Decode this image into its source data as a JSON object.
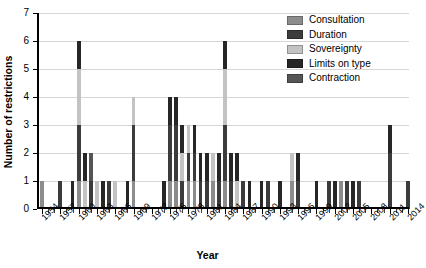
{
  "chart_data": {
    "type": "bar",
    "stacked": true,
    "title": "",
    "xlabel": "Year",
    "ylabel": "Number of restrictions",
    "ylim": [
      0,
      7
    ],
    "yticks": [
      0,
      1,
      2,
      3,
      4,
      5,
      6,
      7
    ],
    "grid": true,
    "legend_position": "top-right",
    "x_start": 1954,
    "x_end": 2014,
    "xtick_labels": [
      "1954",
      "1957",
      "1960",
      "1963",
      "1966",
      "1969",
      "1972",
      "1975",
      "1978",
      "1981",
      "1984",
      "1987",
      "1990",
      "1993",
      "1996",
      "1999",
      "2002",
      "2005",
      "2008",
      "2011",
      "2014"
    ],
    "series": [
      {
        "name": "Consultation",
        "color": "#8c8c8c"
      },
      {
        "name": "Duration",
        "color": "#3b3b3b"
      },
      {
        "name": "Sovereignty",
        "color": "#c3c3c3"
      },
      {
        "name": "Limits on type",
        "color": "#262626"
      },
      {
        "name": "Contraction",
        "color": "#555555"
      }
    ],
    "categories": [
      1954,
      1955,
      1956,
      1957,
      1958,
      1959,
      1960,
      1961,
      1962,
      1963,
      1964,
      1965,
      1966,
      1967,
      1968,
      1969,
      1970,
      1971,
      1972,
      1973,
      1974,
      1975,
      1976,
      1977,
      1978,
      1979,
      1980,
      1981,
      1982,
      1983,
      1984,
      1985,
      1986,
      1987,
      1988,
      1989,
      1990,
      1991,
      1992,
      1993,
      1994,
      1995,
      1996,
      1997,
      1998,
      1999,
      2000,
      2001,
      2002,
      2003,
      2004,
      2005,
      2006,
      2007,
      2008,
      2009,
      2010,
      2011,
      2012,
      2013,
      2014
    ],
    "values": {
      "Consultation": [
        1,
        0,
        0,
        0,
        0,
        0,
        1,
        0,
        0,
        0,
        0,
        0,
        0,
        0,
        0,
        1,
        0,
        0,
        0,
        0,
        0,
        1,
        1,
        0,
        1,
        1,
        0,
        0,
        1,
        0,
        1,
        0,
        0,
        0,
        0,
        0,
        0,
        0,
        0,
        0,
        0,
        1,
        0,
        0,
        0,
        0,
        0,
        0,
        0,
        1,
        0,
        0,
        0,
        0,
        0,
        0,
        0,
        0,
        0,
        0,
        0
      ],
      "Duration": [
        0,
        0,
        0,
        1,
        0,
        0,
        2,
        0,
        1,
        0,
        0,
        1,
        0,
        0,
        0,
        2,
        0,
        0,
        0,
        0,
        0,
        2,
        2,
        1,
        1,
        1,
        1,
        1,
        0,
        1,
        2,
        1,
        0,
        1,
        0,
        0,
        0,
        1,
        0,
        0,
        0,
        0,
        1,
        0,
        0,
        0,
        0,
        1,
        0,
        0,
        1,
        0,
        1,
        0,
        0,
        0,
        0,
        2,
        0,
        0,
        1
      ],
      "Sovereignty": [
        0,
        0,
        0,
        0,
        0,
        0,
        2,
        1,
        0,
        1,
        0,
        0,
        1,
        0,
        0,
        1,
        0,
        0,
        0,
        0,
        0,
        0,
        0,
        1,
        1,
        0,
        0,
        0,
        1,
        0,
        2,
        0,
        1,
        0,
        0,
        0,
        0,
        0,
        0,
        0,
        0,
        1,
        0,
        0,
        0,
        0,
        0,
        0,
        0,
        0,
        0,
        0,
        0,
        0,
        0,
        0,
        0,
        0,
        0,
        0,
        0
      ],
      "Limits on type": [
        0,
        0,
        0,
        0,
        0,
        1,
        1,
        1,
        0,
        0,
        1,
        0,
        0,
        0,
        1,
        0,
        0,
        0,
        0,
        0,
        1,
        1,
        1,
        1,
        0,
        1,
        1,
        1,
        0,
        1,
        1,
        1,
        1,
        0,
        1,
        0,
        1,
        0,
        0,
        1,
        0,
        0,
        1,
        0,
        0,
        1,
        0,
        0,
        1,
        0,
        0,
        1,
        0,
        0,
        0,
        0,
        0,
        1,
        0,
        0,
        0
      ],
      "Contraction": [
        0,
        0,
        0,
        0,
        0,
        0,
        0,
        0,
        1,
        0,
        0,
        0,
        0,
        0,
        0,
        0,
        0,
        0,
        0,
        0,
        0,
        0,
        0,
        0,
        0,
        0,
        0,
        0,
        0,
        0,
        0,
        0,
        0,
        0,
        0,
        0,
        0,
        0,
        0,
        0,
        0,
        0,
        0,
        0,
        0,
        0,
        0,
        0,
        0,
        0,
        0,
        0,
        0,
        0,
        0,
        0,
        0,
        0,
        0,
        0,
        0
      ]
    },
    "totals": [
      1,
      0,
      0,
      1,
      0,
      1,
      6,
      2,
      2,
      1,
      1,
      1,
      1,
      0,
      1,
      4,
      0,
      0,
      0,
      0,
      1,
      4,
      4,
      3,
      3,
      3,
      2,
      2,
      2,
      2,
      6,
      2,
      2,
      1,
      1,
      0,
      1,
      1,
      0,
      1,
      0,
      2,
      2,
      0,
      0,
      1,
      0,
      1,
      1,
      1,
      1,
      1,
      1,
      0,
      0,
      0,
      0,
      3,
      0,
      0,
      1
    ]
  },
  "legend": {
    "items": [
      {
        "label": "Consultation"
      },
      {
        "label": "Duration"
      },
      {
        "label": "Sovereignty"
      },
      {
        "label": "Limits on type"
      },
      {
        "label": "Contraction"
      }
    ]
  }
}
